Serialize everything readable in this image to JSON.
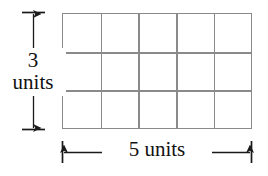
{
  "figure": {
    "background_color": "#ffffff",
    "line_color": "#8a8a8a",
    "text_color": "#111111"
  },
  "grid": {
    "columns": 5,
    "rows": 3,
    "total_cells": 15,
    "cell_labels": [
      "",
      "",
      "",
      "",
      "",
      "",
      "",
      "",
      "",
      "",
      "",
      "",
      "",
      "",
      ""
    ]
  },
  "dimensions": {
    "height": {
      "value": "3",
      "unit": "units",
      "full_text": "3 units",
      "orientation": "vertical",
      "position": "left"
    },
    "width": {
      "value": "5",
      "unit": "units",
      "full_text": "5 units",
      "orientation": "horizontal",
      "position": "bottom"
    }
  },
  "chart_data": {
    "type": "diagram",
    "title": "",
    "shape": "rectangle-grid",
    "columns": 5,
    "rows": 3,
    "area_units": 15,
    "width_label": "5 units",
    "height_label": "3 units"
  }
}
